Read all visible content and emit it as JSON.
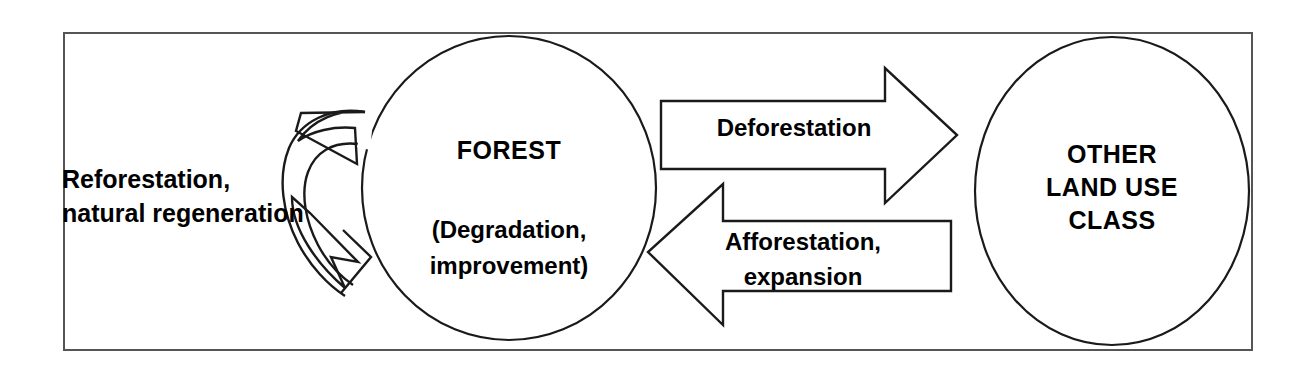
{
  "diagram": {
    "frame": {
      "border_color": "#555555"
    },
    "stroke_color": "#1a1a1a",
    "background": "#ffffff",
    "nodes": [
      {
        "id": "forest",
        "shape": "ellipse",
        "title": "FOREST",
        "subtitle_line1": "(Degradation,",
        "subtitle_line2": "improvement)"
      },
      {
        "id": "other-land-use",
        "shape": "circle",
        "line1": "OTHER",
        "line2": "LAND USE",
        "line3": "CLASS"
      }
    ],
    "arrows": [
      {
        "id": "deforestation",
        "label": "Deforestation",
        "direction": "right",
        "from": "forest",
        "to": "other-land-use"
      },
      {
        "id": "afforestation",
        "label_line1": "Afforestation,",
        "label_line2": "expansion",
        "direction": "left",
        "from": "other-land-use",
        "to": "forest"
      },
      {
        "id": "reforestation",
        "label_line1": "Reforestation,",
        "label_line2": "natural regeneration",
        "direction": "loop",
        "from": "forest",
        "to": "forest"
      }
    ]
  }
}
